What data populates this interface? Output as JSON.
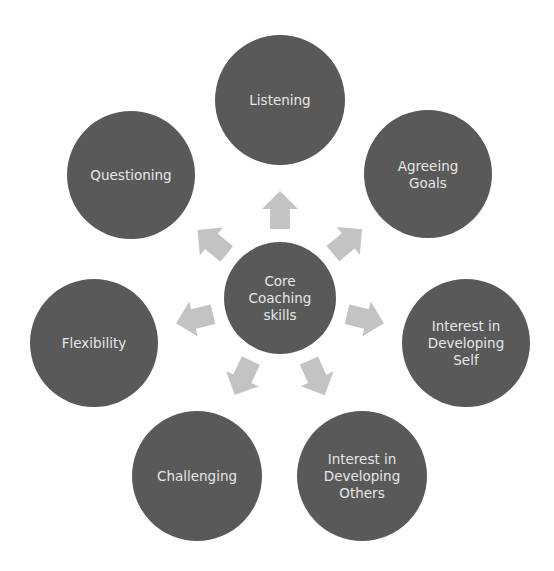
{
  "diagram": {
    "type": "radial-cycle",
    "colors": {
      "node_fill": "#595959",
      "text": "#e6e6e6",
      "arrow_fill": "#c3c3c3",
      "background": "#ffffff"
    },
    "center": {
      "label": "Core Coaching skills",
      "lines": [
        "Core",
        "Coaching",
        "skills"
      ],
      "cx": 280,
      "cy": 298,
      "r": 56
    },
    "nodes": [
      {
        "id": "listening",
        "label": "Listening",
        "lines": [
          "Listening"
        ],
        "cx": 280,
        "cy": 100,
        "r": 65,
        "arrow_angle": -90
      },
      {
        "id": "agreeing-goals",
        "label": "Agreeing Goals",
        "lines": [
          "Agreeing",
          "Goals"
        ],
        "cx": 428,
        "cy": 174,
        "r": 64,
        "arrow_angle": -38
      },
      {
        "id": "interest-developing-self",
        "label": "Interest in Developing Self",
        "lines": [
          "Interest in",
          "Developing",
          "Self"
        ],
        "cx": 466,
        "cy": 343,
        "r": 64,
        "arrow_angle": 13
      },
      {
        "id": "interest-developing-others",
        "label": "Interest in Developing Others",
        "lines": [
          "Interest in",
          "Developing",
          "Others"
        ],
        "cx": 362,
        "cy": 476,
        "r": 65,
        "arrow_angle": 64
      },
      {
        "id": "challenging",
        "label": "Challenging",
        "lines": [
          "Challenging"
        ],
        "cx": 197,
        "cy": 476,
        "r": 65,
        "arrow_angle": 116
      },
      {
        "id": "flexibility",
        "label": "Flexibility",
        "lines": [
          "Flexibility"
        ],
        "cx": 94,
        "cy": 343,
        "r": 64,
        "arrow_angle": 167
      },
      {
        "id": "questioning",
        "label": "Questioning",
        "lines": [
          "Questioning"
        ],
        "cx": 131,
        "cy": 175,
        "r": 64,
        "arrow_angle": -142
      }
    ]
  }
}
